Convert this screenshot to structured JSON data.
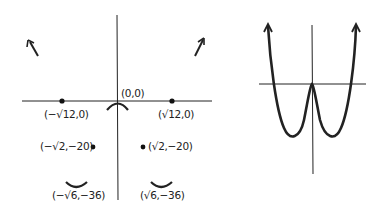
{
  "left_diagram": {
    "origin_label": "(0,0)",
    "labels": [
      {
        "id": "neg-root12",
        "text": "(−√12,0)",
        "x": 44,
        "y": 108
      },
      {
        "id": "pos-root12",
        "text": "(√12,0)",
        "x": 158,
        "y": 108
      },
      {
        "id": "neg-root2",
        "text": "(−√2,−20)",
        "x": 40,
        "y": 140
      },
      {
        "id": "pos-root2",
        "text": "(√2,−20)",
        "x": 148,
        "y": 140
      },
      {
        "id": "neg-root6",
        "text": "(−√6,−36)",
        "x": 52,
        "y": 189
      },
      {
        "id": "pos-root6",
        "text": "(√6,−36)",
        "x": 140,
        "y": 189
      }
    ],
    "points": [
      {
        "name": "x-intercept-negative",
        "label": "(−√12,0)"
      },
      {
        "name": "x-intercept-positive",
        "label": "(√12,0)"
      },
      {
        "name": "inflection-negative",
        "label": "(−√2,−20)"
      },
      {
        "name": "inflection-positive",
        "label": "(√2,−20)"
      }
    ],
    "extrema": [
      {
        "type": "local-max",
        "label": "(0,0)"
      },
      {
        "type": "local-min",
        "label": "(−√6,−36)"
      },
      {
        "type": "local-min",
        "label": "(√6,−36)"
      }
    ]
  },
  "right_diagram": {
    "description": "W-shaped quartic curve with arrows pointing up at both ends"
  }
}
